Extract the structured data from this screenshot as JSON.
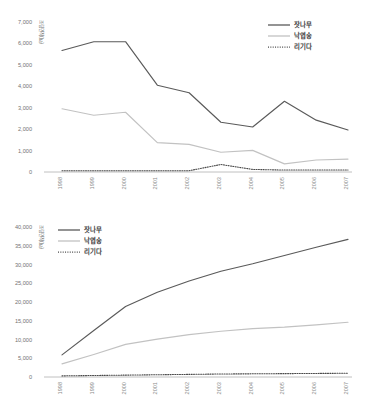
{
  "colors": {
    "series_jatnamu": "#5a5a5a",
    "series_nagyeopsong": "#c2c2c2",
    "series_rigida": "#4a4a4a",
    "axis": "#b0b0b0",
    "tick_text": "#737373",
    "legend_text": "#3a3a3a",
    "background": "#ffffff"
  },
  "charts": [
    {
      "id": "top",
      "chart_data": {
        "type": "line",
        "title": "",
        "xlabel": "",
        "ylabel": "조림면적(㏊)",
        "ylim": [
          0,
          7000
        ],
        "ytick_step": 1000,
        "grid": false,
        "legend_position": "top-right",
        "x": [
          "1998",
          "1999",
          "2000",
          "2001",
          "2002",
          "2003",
          "2004",
          "2005",
          "2006",
          "2007"
        ],
        "ytick_labels": [
          "0",
          "1,000",
          "2,000",
          "3,000",
          "4,000",
          "5,000",
          "6,000",
          "7,000"
        ],
        "series": [
          {
            "name": "잣나무",
            "style": "solid-dark",
            "values": [
              5670,
              6080,
              6080,
              4050,
              3700,
              2320,
              2100,
              3300,
              2420,
              1960
            ]
          },
          {
            "name": "낙엽송",
            "style": "solid-light",
            "values": [
              2950,
              2650,
              2790,
              1370,
              1290,
              920,
              1010,
              380,
              560,
              600
            ]
          },
          {
            "name": "리기다",
            "style": "dotted-dark",
            "values": [
              60,
              60,
              60,
              60,
              60,
              350,
              120,
              90,
              90,
              90
            ]
          }
        ]
      }
    },
    {
      "id": "bottom",
      "chart_data": {
        "type": "line",
        "title": "",
        "xlabel": "",
        "ylabel": "조림면적(㏊)",
        "ylim": [
          0,
          40000
        ],
        "ytick_step": 5000,
        "grid": false,
        "legend_position": "top-left",
        "x": [
          "1998",
          "1999",
          "2000",
          "2001",
          "2002",
          "2003",
          "2004",
          "2005",
          "2006",
          "2007"
        ],
        "ytick_labels": [
          "0",
          "5,000",
          "10,000",
          "15,000",
          "20,000",
          "25,000",
          "30,000",
          "35,000",
          "40,000"
        ],
        "series": [
          {
            "name": "잣나무",
            "style": "solid-dark",
            "values": [
              5900,
              12400,
              18800,
              22600,
              25600,
              28200,
              30200,
              32400,
              34600,
              36700
            ]
          },
          {
            "name": "낙엽송",
            "style": "solid-light",
            "values": [
              3500,
              6000,
              8700,
              10100,
              11300,
              12200,
              12900,
              13300,
              13900,
              14600
            ]
          },
          {
            "name": "리기다",
            "style": "dotted-dark",
            "values": [
              300,
              400,
              500,
              600,
              700,
              800,
              850,
              900,
              950,
              1000
            ]
          }
        ]
      }
    }
  ],
  "legend": {
    "items": [
      {
        "label": "잣나무",
        "style": "solid-dark"
      },
      {
        "label": "낙엽송",
        "style": "solid-light"
      },
      {
        "label": "리기다",
        "style": "dotted-dark"
      }
    ]
  }
}
